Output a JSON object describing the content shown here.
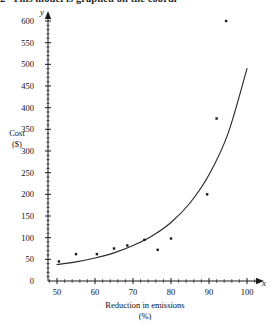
{
  "page": {
    "clipped_header_number": "2",
    "clipped_header_text": "This model is graphed on the coordi"
  },
  "chart_data": {
    "type": "scatter",
    "title": "",
    "xlabel": "Reduction in emissions",
    "xlabel_units": "(%)",
    "ylabel": "Cost",
    "ylabel_units": "($)",
    "x_axis_letter": "x",
    "y_axis_letter": "y",
    "xlim": [
      47,
      103
    ],
    "ylim": [
      0,
      620
    ],
    "xticks": [
      50,
      60,
      70,
      80,
      90,
      100
    ],
    "xticklabels": [
      "50",
      "60",
      "70",
      "80",
      "90",
      "100"
    ],
    "yticks": [
      0,
      50,
      100,
      150,
      200,
      250,
      300,
      350,
      400,
      450,
      500,
      550,
      600
    ],
    "yticklabels": [
      "0",
      "50",
      "100",
      "150",
      "200",
      "250",
      "300",
      "350",
      "400",
      "450",
      "500",
      "550",
      "600"
    ],
    "grid": false,
    "legend": false,
    "minor_ticks": true,
    "points": [
      {
        "x": 50.5,
        "y": 45
      },
      {
        "x": 55.0,
        "y": 62
      },
      {
        "x": 60.5,
        "y": 62
      },
      {
        "x": 65.0,
        "y": 75
      },
      {
        "x": 68.5,
        "y": 82
      },
      {
        "x": 73.0,
        "y": 95
      },
      {
        "x": 76.5,
        "y": 72
      },
      {
        "x": 80.0,
        "y": 98
      },
      {
        "x": 89.5,
        "y": 200
      },
      {
        "x": 92.0,
        "y": 375
      },
      {
        "x": 94.5,
        "y": 600
      }
    ],
    "series": [
      {
        "name": "fitted curve",
        "type": "line",
        "x": [
          50,
          55,
          60,
          65,
          70,
          75,
          80,
          85,
          90,
          95,
          100
        ],
        "y": [
          38,
          44,
          53,
          65,
          82,
          104,
          135,
          180,
          245,
          340,
          490
        ]
      }
    ],
    "point_color": "#1a1a1a",
    "line_color": "#2b2b2b",
    "axis_color": "#1a1a1a"
  }
}
